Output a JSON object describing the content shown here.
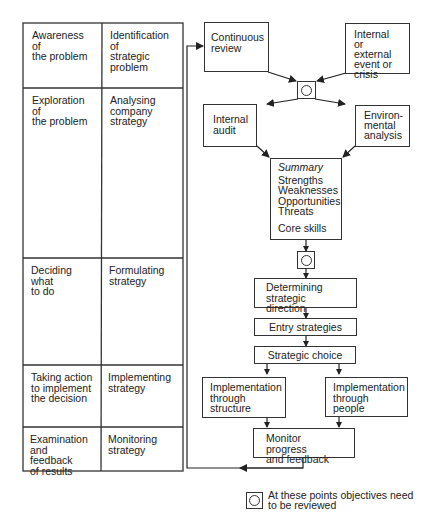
{
  "table": {
    "rows": [
      {
        "stage": "Awareness of the problem",
        "stage_lines": [
          "Awareness of",
          "the problem"
        ],
        "activity_lines": [
          "Identification of",
          "strategic",
          "problem"
        ]
      },
      {
        "stage_lines": [
          "Exploration of",
          "the problem"
        ],
        "activity_lines": [
          "Analysing",
          "company",
          "strategy"
        ]
      },
      {
        "stage_lines": [
          "Deciding what",
          "to do"
        ],
        "activity_lines": [
          "Formulating",
          "strategy"
        ]
      },
      {
        "stage_lines": [
          "Taking action",
          "to implement",
          "the decision"
        ],
        "activity_lines": [
          "Implementing",
          "strategy"
        ]
      },
      {
        "stage_lines": [
          "Examination",
          "and feedback",
          "of results"
        ],
        "activity_lines": [
          "Monitoring",
          "strategy"
        ]
      }
    ]
  },
  "flow": {
    "continuous_review": [
      "Continuous",
      "review"
    ],
    "event_crisis": [
      "Internal",
      "or external",
      "event or",
      "crisis"
    ],
    "internal_audit": [
      "Internal",
      "audit"
    ],
    "environmental_analysis": [
      "Environ-",
      "mental",
      "analysis"
    ],
    "summary": {
      "title": "Summary",
      "items": [
        "Strengths",
        "Weaknesses",
        "Opportunities",
        "Threats"
      ],
      "extra": "Core skills"
    },
    "determining_direction": [
      "Determining",
      "strategic direction"
    ],
    "entry_strategies": "Entry strategies",
    "strategic_choice": "Strategic choice",
    "impl_structure": [
      "Implementation",
      "through",
      "structure"
    ],
    "impl_people": [
      "Implementation",
      "through",
      "people"
    ],
    "monitor": [
      "Monitor progress",
      "and feedback"
    ]
  },
  "legend": {
    "icon": "review-point-icon",
    "lines": [
      "At these points objectives need",
      "to be reviewed"
    ]
  }
}
